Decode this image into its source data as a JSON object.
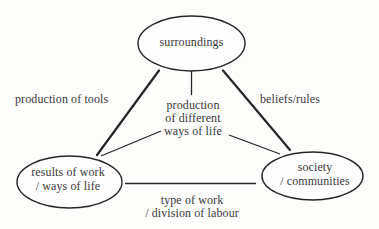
{
  "diagram": {
    "type": "triangle-concept-diagram",
    "nodes": {
      "surroundings": {
        "label": "surroundings"
      },
      "results_of_work": {
        "line1": "results of work",
        "line2": "/ ways of life"
      },
      "society": {
        "line1": "society",
        "line2": "/ communities"
      }
    },
    "edges": {
      "surroundings_results": {
        "label": "production of tools"
      },
      "surroundings_society": {
        "label": "beliefs/rules"
      },
      "surroundings_center": {
        "line1": "production",
        "line2": "of different",
        "line3": "ways of life"
      },
      "results_society": {
        "line1": "type of work",
        "line2": "/ division of labour"
      }
    },
    "colors": {
      "background": "#fdfdfc",
      "line": "#262626",
      "text": "#3a3a3a",
      "node_fill": "#fefefe"
    }
  }
}
